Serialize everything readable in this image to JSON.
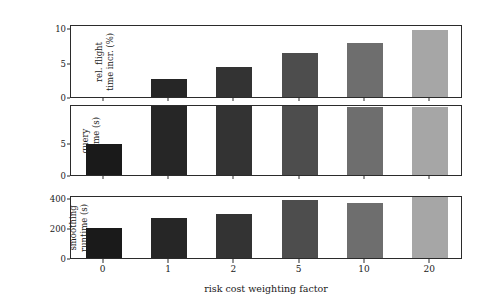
{
  "chart_data": {
    "type": "bar",
    "title": "",
    "subtitle": "",
    "xlabel": "risk cost weighting factor",
    "categories": [
      "0",
      "1",
      "2",
      "5",
      "10",
      "20"
    ],
    "grid": false,
    "legend": null,
    "bar_colors": [
      "#1a1a1a",
      "#262626",
      "#333333",
      "#4d4d4d",
      "#6e6e6e",
      "#a6a6a6"
    ],
    "panels": [
      {
        "id": "flight",
        "ylabel": "rel. flight\ntime incr. (%)",
        "ylabel_text": "rel. flight time incr. (%)",
        "yticks": [
          0,
          5,
          10
        ],
        "yticklabels": [
          "0",
          "5",
          "10"
        ],
        "ylim": [
          0,
          10.6
        ],
        "values": [
          0,
          2.6,
          4.4,
          6.4,
          7.8,
          9.7
        ]
      },
      {
        "id": "query",
        "ylabel": "query\nruntime (s)",
        "ylabel_text": "query runtime (s)",
        "yticks": [
          0,
          5
        ],
        "yticklabels": [
          "0",
          "5"
        ],
        "ylim": [
          0,
          11
        ],
        "values": [
          4.8,
          11.0,
          10.7,
          10.7,
          10.6,
          10.6
        ]
      },
      {
        "id": "smoothing",
        "ylabel": "smoothing\nruntime (s)",
        "ylabel_text": "smoothing runtime (s)",
        "yticks": [
          0,
          200,
          400
        ],
        "yticklabels": [
          "0",
          "200",
          "400"
        ],
        "ylim": [
          0,
          420
        ],
        "values": [
          200,
          270,
          295,
          385,
          370,
          410
        ]
      }
    ]
  }
}
